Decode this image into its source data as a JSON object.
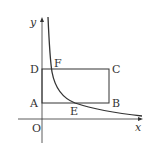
{
  "diagram": {
    "type": "coordinate-geometry",
    "axes": {
      "x_label": "x",
      "y_label": "y",
      "origin_label": "O"
    },
    "points": {
      "A": "A",
      "B": "B",
      "C": "C",
      "D": "D",
      "E": "E",
      "F": "F"
    },
    "shapes": {
      "rectangle": "ABCD",
      "curve": "decreasing curve through F and E"
    },
    "colors": {
      "stroke": "#333333",
      "background": "#ffffff"
    }
  }
}
